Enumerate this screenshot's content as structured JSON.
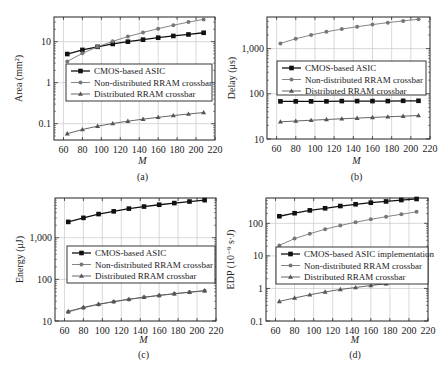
{
  "figure": {
    "panels": [
      "(a)",
      "(b)",
      "(c)",
      "(d)"
    ]
  },
  "chart_data": [
    {
      "panel": "(a)",
      "type": "line",
      "title": "",
      "xlabel": "M",
      "ylabel": "Area (mm²)",
      "yscale": "log",
      "xlim": [
        50,
        220
      ],
      "ylim": [
        0.04,
        40
      ],
      "xticks": [
        60,
        80,
        100,
        120,
        140,
        160,
        180,
        200,
        220
      ],
      "yticks": [
        0.1,
        1,
        10
      ],
      "ytick_labels": [
        "0.1",
        "1",
        "10"
      ],
      "grid": true,
      "legend_position": "center-left",
      "x": [
        64,
        80,
        96,
        112,
        128,
        144,
        160,
        176,
        192,
        208
      ],
      "series": [
        {
          "name": "CMOS-based ASIC",
          "marker": "square",
          "color": "#111111",
          "values": [
            5.0,
            6.3,
            7.5,
            8.8,
            10.0,
            11.2,
            12.5,
            13.8,
            15.0,
            16.5
          ]
        },
        {
          "name": "Non-distributed RRAM crossbar",
          "marker": "circle",
          "color": "#777777",
          "values": [
            3.3,
            5.2,
            7.5,
            10.2,
            13.3,
            16.8,
            20.8,
            25.2,
            30.0,
            35.0
          ]
        },
        {
          "name": "Distributed RRAM crossbar",
          "marker": "triangle",
          "color": "#555555",
          "values": [
            0.057,
            0.072,
            0.087,
            0.101,
            0.115,
            0.129,
            0.143,
            0.158,
            0.172,
            0.187
          ]
        }
      ]
    },
    {
      "panel": "(b)",
      "type": "line",
      "title": "",
      "xlabel": "M",
      "ylabel": "Delay (μs)",
      "yscale": "log",
      "xlim": [
        50,
        220
      ],
      "ylim": [
        10,
        5000
      ],
      "xticks": [
        60,
        80,
        100,
        120,
        140,
        160,
        180,
        200,
        220
      ],
      "yticks": [
        10,
        100,
        1000
      ],
      "ytick_labels": [
        "10",
        "100",
        "1,000"
      ],
      "grid": true,
      "legend_position": "center-left",
      "x": [
        64,
        80,
        96,
        112,
        128,
        144,
        160,
        176,
        192,
        208
      ],
      "series": [
        {
          "name": "CMOS-based ASIC",
          "marker": "square",
          "color": "#111111",
          "values": [
            68,
            68,
            68,
            68,
            69,
            69,
            69,
            69,
            70,
            70
          ]
        },
        {
          "name": "Non-distributed RRAM crossbar",
          "marker": "circle",
          "color": "#777777",
          "values": [
            1300,
            1650,
            2000,
            2350,
            2700,
            3050,
            3400,
            3750,
            4100,
            4450
          ]
        },
        {
          "name": "Distributed RRAM crossbar",
          "marker": "triangle",
          "color": "#555555",
          "values": [
            24,
            25,
            26,
            27,
            28,
            29,
            30,
            31,
            32,
            33
          ]
        }
      ]
    },
    {
      "panel": "(c)",
      "type": "line",
      "title": "",
      "xlabel": "M",
      "ylabel": "Energy (μJ)",
      "yscale": "log",
      "xlim": [
        50,
        220
      ],
      "ylim": [
        10,
        9000
      ],
      "xticks": [
        60,
        80,
        100,
        120,
        140,
        160,
        180,
        200,
        220
      ],
      "yticks": [
        10,
        100,
        1000
      ],
      "ytick_labels": [
        "10",
        "100",
        "1,000"
      ],
      "grid": true,
      "legend_position": "center-left",
      "x": [
        64,
        80,
        96,
        112,
        128,
        144,
        160,
        176,
        192,
        208
      ],
      "series": [
        {
          "name": "CMOS-based ASIC",
          "marker": "square",
          "color": "#111111",
          "values": [
            2400,
            3000,
            3700,
            4300,
            5000,
            5600,
            6200,
            6800,
            7400,
            8000
          ]
        },
        {
          "name": "Non-distributed RRAM crossbar",
          "marker": "circle",
          "color": "#777777",
          "values": [
            16.5,
            20.8,
            25.0,
            29.0,
            33.0,
            37.0,
            41.0,
            45.0,
            49.0,
            53.0
          ]
        },
        {
          "name": "Distributed RRAM crossbar",
          "marker": "triangle",
          "color": "#555555",
          "values": [
            17.0,
            21.2,
            25.3,
            29.3,
            33.3,
            37.3,
            41.3,
            45.3,
            49.3,
            53.5
          ]
        }
      ]
    },
    {
      "panel": "(d)",
      "type": "line",
      "title": "",
      "xlabel": "M",
      "ylabel": "EDP (10⁻⁹ s·J)",
      "yscale": "log",
      "xlim": [
        50,
        220
      ],
      "ylim": [
        0.1,
        600
      ],
      "xticks": [
        60,
        80,
        100,
        120,
        140,
        160,
        180,
        200,
        220
      ],
      "yticks": [
        0.1,
        1,
        10,
        100
      ],
      "ytick_labels": [
        "0.1",
        "1",
        "10",
        "100"
      ],
      "grid": true,
      "legend_position": "center-left",
      "x": [
        64,
        80,
        96,
        112,
        128,
        144,
        160,
        176,
        192,
        208
      ],
      "series": [
        {
          "name": "CMOS-based ASIC implementation",
          "marker": "square",
          "color": "#111111",
          "values": [
            165,
            205,
            250,
            290,
            340,
            385,
            430,
            470,
            520,
            560
          ]
        },
        {
          "name": "Non-distributed RRAM crossbar",
          "marker": "circle",
          "color": "#777777",
          "values": [
            21,
            34,
            48,
            66,
            86,
            108,
            133,
            160,
            190,
            225
          ]
        },
        {
          "name": "Distributed RRAM crossbar",
          "marker": "triangle",
          "color": "#555555",
          "values": [
            0.4,
            0.51,
            0.64,
            0.78,
            0.93,
            1.07,
            1.23,
            1.4,
            1.57,
            1.76
          ]
        }
      ]
    }
  ]
}
